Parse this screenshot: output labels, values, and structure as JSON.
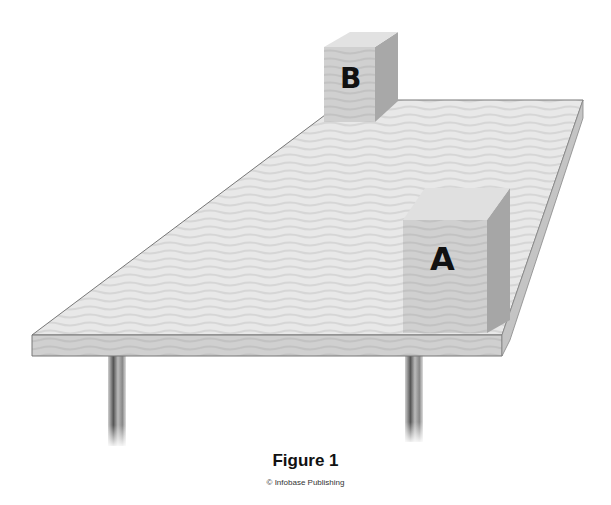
{
  "figure": {
    "caption": "Figure 1",
    "credit": "© Infobase Publishing"
  },
  "objects": {
    "box_a": {
      "label": "A"
    },
    "box_b": {
      "label": "B"
    },
    "table": {
      "legs": 2
    }
  },
  "colors": {
    "table_top": "#e6e6e6",
    "table_edge": "#cfcfcf",
    "box_front": "#d2d2d2",
    "box_side": "#a9a9a9",
    "box_top": "#e3e3e3",
    "leg": "#8a8a8a"
  }
}
